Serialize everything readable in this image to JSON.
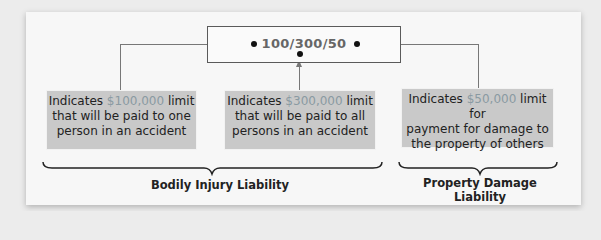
{
  "code": "100/300/50",
  "boxes": [
    {
      "prefix": "Indicates ",
      "amount": "$100,000",
      "suffix": " limit",
      "line2": "that will be paid to one",
      "line3": "person in an accident"
    },
    {
      "prefix": "Indicates ",
      "amount": "$300,000",
      "suffix": " limit",
      "line2": "that will be paid to all",
      "line3": "persons in an accident"
    },
    {
      "prefix": "Indicates ",
      "amount": "$50,000",
      "suffix": " limit for",
      "line2": "payment for damage to",
      "line3": "the property of others"
    }
  ],
  "labels": {
    "bodily": "Bodily Injury Liability",
    "property": "Property Damage Liability"
  },
  "colors": {
    "amount": "#8a9aa2",
    "box": "#c9c9c9",
    "connector": "#777777"
  }
}
